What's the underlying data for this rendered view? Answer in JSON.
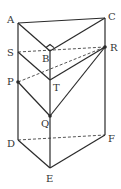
{
  "diagram": {
    "type": "triangular-prism",
    "labels": {
      "A": "A",
      "B": "B",
      "C": "C",
      "D": "D",
      "E": "E",
      "F": "F",
      "P": "P",
      "Q": "Q",
      "R": "R",
      "S": "S",
      "T": "T"
    },
    "right_angle_at": "B",
    "solid_edges": [
      "A-C",
      "A-B",
      "B-C",
      "A-D",
      "C-F",
      "B-E",
      "D-E",
      "E-F",
      "S-T",
      "P-Q",
      "T-R",
      "Q-R"
    ],
    "dashed_edges": [
      "S-R",
      "P-R",
      "D-F"
    ],
    "marked_points": [
      "P",
      "Q",
      "R"
    ],
    "colors": {
      "stroke": "#2a2a2a",
      "label": "#333333",
      "background": "#ffffff"
    }
  }
}
